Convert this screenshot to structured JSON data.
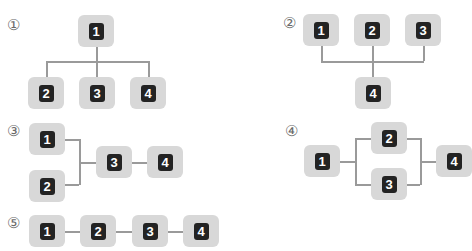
{
  "diagrams": [
    {
      "label": "①",
      "type": "one-to-many tree",
      "nodes": [
        "1",
        "2",
        "3",
        "4"
      ],
      "edges": [
        [
          "1",
          "2"
        ],
        [
          "1",
          "3"
        ],
        [
          "1",
          "4"
        ]
      ]
    },
    {
      "label": "②",
      "type": "many-to-one tree",
      "nodes": [
        "1",
        "2",
        "3",
        "4"
      ],
      "edges": [
        [
          "1",
          "4"
        ],
        [
          "2",
          "4"
        ],
        [
          "3",
          "4"
        ]
      ]
    },
    {
      "label": "③",
      "type": "merge then chain",
      "nodes": [
        "1",
        "2",
        "3",
        "4"
      ],
      "edges": [
        [
          "1",
          "3"
        ],
        [
          "2",
          "3"
        ],
        [
          "3",
          "4"
        ]
      ]
    },
    {
      "label": "④",
      "type": "parallel branch",
      "nodes": [
        "1",
        "2",
        "3",
        "4"
      ],
      "edges": [
        [
          "1",
          "2"
        ],
        [
          "1",
          "3"
        ],
        [
          "2",
          "4"
        ],
        [
          "3",
          "4"
        ]
      ]
    },
    {
      "label": "⑤",
      "type": "linear chain",
      "nodes": [
        "1",
        "2",
        "3",
        "4"
      ],
      "edges": [
        [
          "1",
          "2"
        ],
        [
          "2",
          "3"
        ],
        [
          "3",
          "4"
        ]
      ]
    }
  ],
  "colors": {
    "node_fill": "#d8d8d8",
    "badge_fill": "#232323",
    "badge_text": "#ffffff",
    "connector": "#9a9a9a",
    "label": "#6a6a6a"
  }
}
